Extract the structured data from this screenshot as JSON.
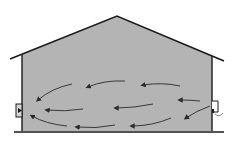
{
  "diagram": {
    "title": "Building cross-section airflow",
    "colors": {
      "background": "#ffffff",
      "interior_fill": "#b4b4b4",
      "outline": "#1a1a1a",
      "arrow": "#2a2a2a"
    },
    "building": {
      "roof": [
        [
          10,
          59
        ],
        [
          117,
          16
        ],
        [
          224,
          61
        ]
      ],
      "left_wall_x": 22,
      "right_wall_x": 212,
      "wall_top_left_y": 55,
      "wall_top_right_y": 56,
      "floor_y": 131,
      "ground": [
        [
          14,
          132
        ],
        [
          224,
          132
        ]
      ]
    },
    "fixtures": {
      "left_fan": {
        "label": "exhaust-fan",
        "x": 16,
        "y": 104,
        "w": 6,
        "h": 13
      },
      "right_inlet": {
        "label": "air-inlet",
        "x": 212,
        "y": 101,
        "w": 6,
        "h": 11
      }
    },
    "arrows": [
      {
        "from": [
          72,
          84
        ],
        "ctrl": [
          52,
          88
        ],
        "to": [
          38,
          100
        ]
      },
      {
        "from": [
          125,
          81
        ],
        "ctrl": [
          104,
          80
        ],
        "to": [
          88,
          87
        ]
      },
      {
        "from": [
          180,
          86
        ],
        "ctrl": [
          162,
          82
        ],
        "to": [
          143,
          85
        ]
      },
      {
        "from": [
          200,
          101
        ],
        "ctrl": [
          190,
          100
        ],
        "to": [
          180,
          100
        ]
      },
      {
        "from": [
          83,
          109
        ],
        "ctrl": [
          64,
          112
        ],
        "to": [
          47,
          110
        ]
      },
      {
        "from": [
          153,
          104
        ],
        "ctrl": [
          134,
          108
        ],
        "to": [
          116,
          108
        ]
      },
      {
        "from": [
          210,
          106
        ],
        "ctrl": [
          196,
          111
        ],
        "to": [
          186,
          118
        ]
      },
      {
        "from": [
          67,
          126
        ],
        "ctrl": [
          46,
          124
        ],
        "to": [
          32,
          116
        ]
      },
      {
        "from": [
          115,
          125
        ],
        "ctrl": [
          96,
          129
        ],
        "to": [
          77,
          127
        ]
      },
      {
        "from": [
          171,
          118
        ],
        "ctrl": [
          152,
          126
        ],
        "to": [
          132,
          126
        ]
      }
    ]
  }
}
